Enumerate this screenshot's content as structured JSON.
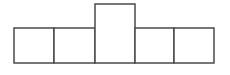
{
  "diagram": {
    "stroke_color": "#4a4a4a",
    "fill_color": "#ffffff",
    "stroke_width": 1.5,
    "shapes": [
      {
        "id": "box-1",
        "x": 14,
        "y": 28,
        "w": 40,
        "h": 35
      },
      {
        "id": "box-2",
        "x": 54,
        "y": 28,
        "w": 41,
        "h": 35
      },
      {
        "id": "box-3-tall",
        "x": 95,
        "y": 4,
        "w": 40,
        "h": 59
      },
      {
        "id": "box-4",
        "x": 135,
        "y": 28,
        "w": 39,
        "h": 35
      },
      {
        "id": "box-5",
        "x": 174,
        "y": 28,
        "w": 40,
        "h": 35
      }
    ]
  }
}
